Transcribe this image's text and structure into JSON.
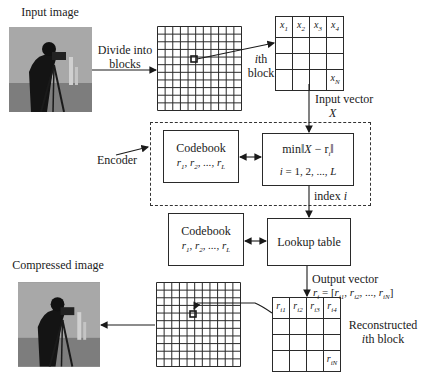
{
  "diagram": {
    "type": "vector-quantization-image-compression-flow",
    "input_image": {
      "label": "Input image",
      "icon": "cameraman-photo"
    },
    "divide_step": {
      "label_line1": "Divide into",
      "label_line2": "blocks"
    },
    "block_grid": {
      "rows": 11,
      "cols": 11,
      "highlight": "selected-block"
    },
    "ith_block": {
      "label_line1": "ith",
      "label_line2": "block",
      "cells": [
        "x1",
        "x2",
        "x3",
        "x4",
        "",
        "",
        "",
        "",
        "",
        "",
        "",
        "",
        "",
        "",
        "",
        "xN"
      ]
    },
    "input_vector": {
      "label": "Input vector",
      "symbol": "X"
    },
    "encoder": {
      "label": "Encoder",
      "codebook": {
        "title": "Codebook",
        "entries": "r1, r2, ..., rL"
      },
      "search": {
        "formula": "min‖X − ri‖",
        "range": "i = 1, 2, ..., L"
      }
    },
    "index": {
      "label": "index i"
    },
    "decoder": {
      "codebook": {
        "title": "Codebook",
        "entries": "r1, r2, ..., rL"
      },
      "lookup": {
        "title": "Lookup table"
      }
    },
    "output_vector": {
      "label": "Output vector",
      "formula": "ri = [ri1, ri2, ..., riN]"
    },
    "reconstructed_block": {
      "label_line1": "Reconstructed",
      "label_line2": "ith block",
      "cells": [
        "ri1",
        "ri2",
        "ri3",
        "ri4",
        "",
        "",
        "",
        "",
        "",
        "",
        "",
        "",
        "",
        "",
        "",
        "riN"
      ]
    },
    "output_grid": {
      "rows": 11,
      "cols": 11
    },
    "compressed_image": {
      "label": "Compressed image",
      "icon": "cameraman-photo"
    }
  },
  "colors": {
    "line": "#2a2a2a",
    "background": "#ffffff",
    "photo_gray": "#9b9b9b"
  }
}
